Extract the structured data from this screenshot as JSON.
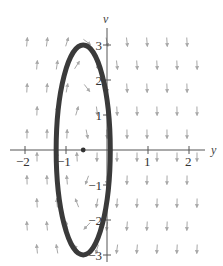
{
  "chart_data": {
    "type": "scatter",
    "title": "",
    "subtitle": "Phase plane with direction field and closed solution curve",
    "xlabel": "y",
    "ylabel": "v",
    "xlim": [
      -2.3,
      2.3
    ],
    "ylim": [
      -3.3,
      3.5
    ],
    "x_ticks": [
      -2,
      -1,
      1,
      2
    ],
    "y_ticks": [
      -3,
      -2,
      -1,
      1,
      2,
      3
    ],
    "x_tick_labels": [
      "−2",
      "−1",
      "1",
      "2"
    ],
    "y_tick_labels": [
      "−3",
      "−2",
      "−1",
      "1",
      "2",
      "3"
    ],
    "grid": false,
    "legend": null,
    "series": [
      {
        "name": "solution curve",
        "kind": "ellipse",
        "center": [
          -0.58,
          0
        ],
        "semi_axis_x": 0.66,
        "semi_axis_v": 3.0,
        "color": "#3a3a3a"
      },
      {
        "name": "equilibrium point",
        "kind": "point",
        "x": [
          -0.58
        ],
        "y": [
          0
        ],
        "color": "#333333"
      },
      {
        "name": "direction field",
        "kind": "vector-field",
        "description": "Arrows point upward for y < about -0.6 and downward for y > about -0.6; arrows are nearly vertical away from the equilibrium and tilt near it",
        "color": "#a0a0a0"
      }
    ]
  },
  "colors": {
    "axis": "#555555",
    "curve": "#3a3a3a",
    "arrows": "#a8a8a8",
    "background": "#ffffff"
  }
}
